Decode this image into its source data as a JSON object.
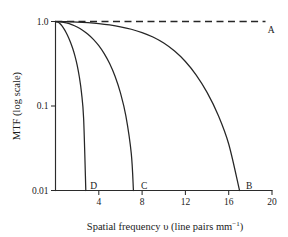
{
  "chart_data": {
    "type": "line",
    "title": "",
    "xlabel": "Spatial frequency υ (line pairs mm⁻¹)",
    "xlabel_main": "Spatial frequency υ (line pairs mm",
    "xlabel_sup": "−1",
    "xlabel_tail": ")",
    "ylabel": "MTF (log scale)",
    "xlim": [
      0,
      20
    ],
    "ylim": [
      0.01,
      1.0
    ],
    "yscale": "log",
    "xscale": "linear",
    "grid": false,
    "legend": "none",
    "xticks": [
      4,
      8,
      12,
      16,
      20
    ],
    "xtick_labels": [
      "4",
      "8",
      "12",
      "16",
      "20"
    ],
    "yticks": [
      1.0,
      0.1,
      0.01
    ],
    "ytick_labels": [
      "1.0",
      "0.1",
      "0.01"
    ],
    "series": [
      {
        "name": "A",
        "label": "A",
        "style": "dashed",
        "description": "Ideal system, MTF constant at 1.0",
        "x": [
          0,
          2,
          4,
          6,
          8,
          10,
          12,
          14,
          16,
          18,
          19.4
        ],
        "y": [
          1.0,
          1.0,
          1.0,
          1.0,
          1.0,
          1.0,
          1.0,
          1.0,
          1.0,
          1.0,
          1.0
        ],
        "label_x": 19.6,
        "label_y": 0.74
      },
      {
        "name": "B",
        "label": "B",
        "style": "solid",
        "description": "Widest bandwidth, MTF falls to 0.01 near 17 lp/mm",
        "x": [
          0,
          1,
          2,
          3,
          4,
          5,
          6,
          7,
          8,
          9,
          10,
          11,
          12,
          13,
          14,
          15,
          16,
          17
        ],
        "y": [
          1.0,
          0.995,
          0.985,
          0.968,
          0.944,
          0.91,
          0.866,
          0.81,
          0.74,
          0.655,
          0.556,
          0.447,
          0.336,
          0.232,
          0.145,
          0.0795,
          0.0355,
          0.01
        ],
        "label_x": 17.6,
        "label_y": 0.0105
      },
      {
        "name": "C",
        "label": "C",
        "style": "solid",
        "description": "Intermediate bandwidth, MTF falls to 0.01 near 7.2 lp/mm",
        "x": [
          0,
          0.5,
          1,
          1.5,
          2,
          2.5,
          3,
          3.5,
          4,
          4.5,
          5,
          5.5,
          6,
          6.5,
          7,
          7.2
        ],
        "y": [
          1.0,
          0.99,
          0.962,
          0.92,
          0.862,
          0.79,
          0.707,
          0.615,
          0.518,
          0.417,
          0.318,
          0.225,
          0.143,
          0.0765,
          0.0275,
          0.01
        ],
        "label_x": 7.9,
        "label_y": 0.0105
      },
      {
        "name": "D",
        "label": "D",
        "style": "solid",
        "description": "Narrowest bandwidth, MTF falls to 0.01 near 2.8 lp/mm",
        "x": [
          0,
          0.2,
          0.4,
          0.6,
          0.8,
          1.0,
          1.2,
          1.4,
          1.6,
          1.8,
          2.0,
          2.2,
          2.4,
          2.6,
          2.8
        ],
        "y": [
          1.0,
          0.985,
          0.945,
          0.885,
          0.812,
          0.732,
          0.648,
          0.562,
          0.476,
          0.39,
          0.305,
          0.222,
          0.144,
          0.0705,
          0.01
        ]
      }
    ],
    "annotations": [
      {
        "text": "A",
        "x": 19.6,
        "y": 0.74
      },
      {
        "text": "B",
        "x": 17.6,
        "y": 0.0105
      },
      {
        "text": "C",
        "x": 7.9,
        "y": 0.0105
      },
      {
        "text": "D",
        "x": 3.2,
        "y": 0.0105
      }
    ],
    "colors": {
      "curve": "#262626",
      "axis": "#2b2b2b",
      "background": "#ffffff"
    }
  }
}
